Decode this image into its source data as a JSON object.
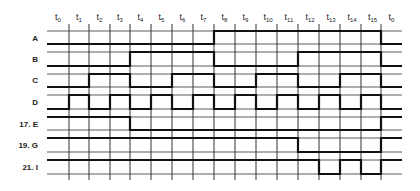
{
  "diagram": {
    "type": "timing-diagram",
    "time_labels": [
      {
        "base": "t",
        "sub": "0"
      },
      {
        "base": "t",
        "sub": "1"
      },
      {
        "base": "t",
        "sub": "2"
      },
      {
        "base": "t",
        "sub": "3"
      },
      {
        "base": "t",
        "sub": "4"
      },
      {
        "base": "t",
        "sub": "5"
      },
      {
        "base": "t",
        "sub": "6"
      },
      {
        "base": "t",
        "sub": "7"
      },
      {
        "base": "t",
        "sub": "8"
      },
      {
        "base": "t",
        "sub": "9"
      },
      {
        "base": "t",
        "sub": "10"
      },
      {
        "base": "t",
        "sub": "11"
      },
      {
        "base": "t",
        "sub": "12"
      },
      {
        "base": "t",
        "sub": "13"
      },
      {
        "base": "t",
        "sub": "14"
      },
      {
        "base": "t",
        "sub": "15"
      },
      {
        "base": "t",
        "sub": "0"
      }
    ],
    "signals": [
      {
        "label": "A",
        "states": [
          0,
          0,
          0,
          0,
          0,
          0,
          0,
          0,
          1,
          1,
          1,
          1,
          1,
          1,
          1,
          1,
          0
        ]
      },
      {
        "label": "B",
        "states": [
          0,
          0,
          0,
          0,
          1,
          1,
          1,
          1,
          0,
          0,
          0,
          0,
          1,
          1,
          1,
          1,
          0
        ]
      },
      {
        "label": "C",
        "states": [
          0,
          0,
          1,
          1,
          0,
          0,
          1,
          1,
          0,
          0,
          1,
          1,
          0,
          0,
          1,
          1,
          0
        ]
      },
      {
        "label": "D",
        "states": [
          0,
          1,
          0,
          1,
          0,
          1,
          0,
          1,
          0,
          1,
          0,
          1,
          0,
          1,
          0,
          1,
          0
        ]
      },
      {
        "label": "17. E",
        "states": [
          1,
          1,
          1,
          1,
          0,
          0,
          0,
          0,
          0,
          0,
          0,
          0,
          0,
          0,
          0,
          0,
          1
        ]
      },
      {
        "label": "19. G",
        "states": [
          1,
          1,
          1,
          1,
          1,
          1,
          1,
          1,
          1,
          1,
          1,
          1,
          0,
          0,
          0,
          0,
          1
        ]
      },
      {
        "label": "21. I",
        "states": [
          1,
          1,
          1,
          1,
          1,
          1,
          1,
          1,
          1,
          1,
          1,
          1,
          1,
          0,
          1,
          0,
          1
        ]
      }
    ],
    "colors": {
      "line": "#111111",
      "grid": "#333333",
      "background": "#ffffff"
    }
  }
}
